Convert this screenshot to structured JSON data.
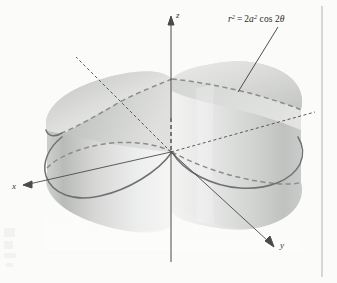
{
  "figure": {
    "kind": "3d-surface-plot",
    "caption_equation": "r² = 2a² cos 2θ",
    "equation_parts": {
      "r": "r",
      "r_exponent": "2",
      "equals": "=",
      "coefficient": "2",
      "a": "a",
      "a_exponent": "2",
      "cos": "cos",
      "angle_coefficient": "2",
      "theta": "θ"
    },
    "axes": [
      {
        "id": "z",
        "label": "z",
        "direction": "up",
        "style": "solid-with-arrow"
      },
      {
        "id": "y",
        "label": "y",
        "direction": "down-right",
        "style": "solid-with-arrow"
      },
      {
        "id": "x",
        "label": "x",
        "direction": "down-left",
        "style": "solid-with-arrow"
      }
    ],
    "colors": {
      "background": "#fbfbf9",
      "surface_light": "#f4f4f2",
      "surface_mid": "#d9dad8",
      "surface_dark": "#bdbfbd",
      "curve_visible": "#6d6f70",
      "curve_hidden": "#8a8c8d",
      "axis": "#4a4a4a",
      "text": "#2b2b2b",
      "page_border": "#b9b9b6"
    },
    "curve_styles": {
      "front_curve": "solid",
      "hidden_curve": "dashed",
      "hidden_axis": "dashed"
    },
    "annotation": {
      "leader_line": "from equation label down-left to upper dashed lemniscate curve"
    },
    "page_border": {
      "present": true,
      "side": "right"
    }
  }
}
